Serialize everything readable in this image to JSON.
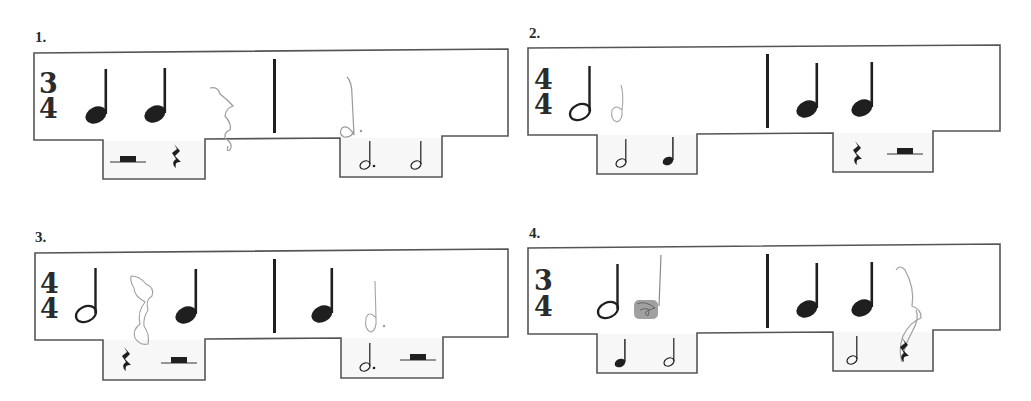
{
  "worksheet": {
    "exercises": [
      {
        "number": "1.",
        "time_signature": {
          "top": "3",
          "bottom": "4"
        },
        "measure_1": [
          "quarter-note",
          "quarter-note",
          "student-drawn quarter-rest (pencil)"
        ],
        "measure_2": [
          "student-drawn dotted half-note (pencil)"
        ],
        "answer_choices_left": [
          "half-rest",
          "quarter-rest"
        ],
        "answer_choices_right": [
          "dotted-half-note",
          "half-note"
        ]
      },
      {
        "number": "2.",
        "time_signature": {
          "top": "4",
          "bottom": "4"
        },
        "measure_1": [
          "half-note",
          "student-drawn half-note (pencil)"
        ],
        "measure_2": [
          "quarter-note",
          "quarter-note"
        ],
        "answer_choices_left": [
          "half-note",
          "quarter-note"
        ],
        "answer_choices_right": [
          "quarter-rest",
          "half-rest"
        ]
      },
      {
        "number": "3.",
        "time_signature": {
          "top": "4",
          "bottom": "4"
        },
        "measure_1": [
          "half-note",
          "student-drawn quarter-rest (pencil)",
          "quarter-note"
        ],
        "measure_2": [
          "quarter-note",
          "student-drawn dotted half-note (pencil)"
        ],
        "answer_choices_left": [
          "quarter-rest",
          "half-rest"
        ],
        "answer_choices_right": [
          "dotted-half-note",
          "half-rest"
        ]
      },
      {
        "number": "4.",
        "time_signature": {
          "top": "3",
          "bottom": "4"
        },
        "measure_1": [
          "half-note",
          "student-drawn quarter-note (pencil, scribbled)"
        ],
        "measure_2": [
          "quarter-note",
          "quarter-note",
          "student-drawn quarter-rest (pencil)"
        ],
        "answer_choices_left": [
          "quarter-note",
          "half-note"
        ],
        "answer_choices_right": [
          "half-note",
          "quarter-rest"
        ]
      }
    ]
  },
  "colors": {
    "ink": "#1f1f1f",
    "outline": "#555555",
    "pencil": "#9a9a9a",
    "tab_fill": "#f7f7f7"
  }
}
